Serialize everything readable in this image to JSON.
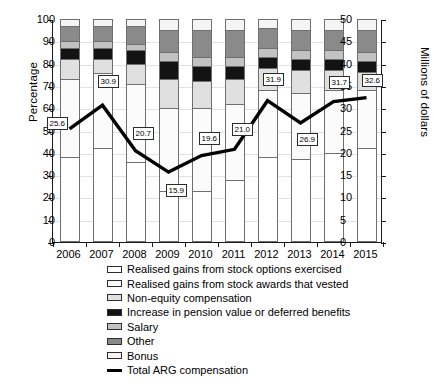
{
  "chart_data": {
    "type": "bar",
    "title": "",
    "subtitle": "",
    "ylabel": "Percentage",
    "ylabel_right": "Millions of dollars",
    "xlabel": "",
    "grid": true,
    "legend_position": "bottom",
    "categories": [
      "2006",
      "2007",
      "2008",
      "2009",
      "2010",
      "2011",
      "2012",
      "2013",
      "2014",
      "2015"
    ],
    "ylim": [
      0,
      100
    ],
    "ylim_right": [
      0,
      50
    ],
    "yticks": [
      0,
      10,
      20,
      30,
      40,
      50,
      60,
      70,
      80,
      90,
      100
    ],
    "yticks_right": [
      0,
      5,
      10,
      15,
      20,
      25,
      30,
      35,
      40,
      45,
      50
    ],
    "series": [
      {
        "name": "Realised gains from stock options exercised",
        "color": "#ffffff",
        "values": [
          38,
          42,
          36,
          23,
          23,
          28,
          38,
          37,
          40,
          42
        ]
      },
      {
        "name": "Realised gains from stock awards that vested",
        "color": "#fbfbfb",
        "values": [
          35,
          34,
          35,
          37,
          37,
          34,
          30,
          30,
          28,
          26
        ]
      },
      {
        "name": "Non-equity compensation",
        "color": "#e0e0e0",
        "values": [
          9,
          6,
          9,
          13,
          12,
          11,
          10,
          10,
          9,
          8
        ]
      },
      {
        "name": "Increase in pension value or deferred benefits",
        "color": "#131313",
        "values": [
          5,
          5,
          6,
          8,
          7,
          6,
          5,
          5,
          5,
          5
        ]
      },
      {
        "name": "Salary",
        "color": "#c2c2c2",
        "values": [
          3,
          3,
          3,
          4,
          4,
          4,
          4,
          4,
          4,
          4
        ]
      },
      {
        "name": "Other",
        "color": "#8a8a8a",
        "values": [
          7,
          7,
          8,
          10,
          12,
          12,
          9,
          9,
          9,
          10
        ]
      },
      {
        "name": "Bonus",
        "color": "#f4f4f4",
        "values": [
          3,
          3,
          3,
          5,
          5,
          5,
          4,
          5,
          5,
          5
        ]
      }
    ],
    "line_series": {
      "name": "Total ARG compensation",
      "color": "#000000",
      "axis": "right",
      "values": [
        25.6,
        30.9,
        20.7,
        15.9,
        19.6,
        21.0,
        31.9,
        26.9,
        31.7,
        32.6
      ],
      "labels": [
        "25.6",
        "30.9",
        "20.7",
        "15.9",
        "19.6",
        "21.0",
        "31.9",
        "26.9",
        "31.7",
        "32.6"
      ]
    },
    "legend": [
      "Realised gains from stock options exercised",
      "Realised gains from stock awards that vested",
      "Non-equity compensation",
      "Increase in pension value or deferred benefits",
      "Salary",
      "Other",
      "Bonus",
      "Total ARG compensation"
    ]
  }
}
